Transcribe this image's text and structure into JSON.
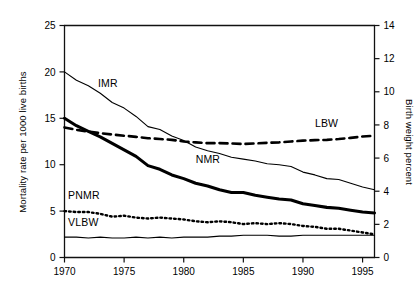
{
  "chart_data": {
    "type": "line",
    "title": "",
    "subtitle": "",
    "xlabel": "",
    "ylabel": "Mortality rate per 1000 live births",
    "y2label": "Birth weight percent",
    "xlim": [
      1970,
      1996
    ],
    "ylim": [
      0,
      25
    ],
    "y2lim": [
      0,
      14
    ],
    "grid": false,
    "legend_position": "inline-labels",
    "xticks": [
      1970,
      1975,
      1980,
      1985,
      1990,
      1995
    ],
    "xtick_labels": [
      "1970",
      "1975",
      "1980",
      "1985",
      "1990",
      "1995"
    ],
    "yticks": [
      0,
      5,
      10,
      15,
      20,
      25
    ],
    "ytick_labels": [
      "0",
      "5",
      "10",
      "15",
      "20",
      "25"
    ],
    "y2ticks": [
      0,
      2,
      4,
      6,
      8,
      10,
      12,
      14
    ],
    "y2tick_labels": [
      "0",
      "2",
      "4",
      "6",
      "8",
      "10",
      "12",
      "14"
    ],
    "x": [
      1970,
      1971,
      1972,
      1973,
      1974,
      1975,
      1976,
      1977,
      1978,
      1979,
      1980,
      1981,
      1982,
      1983,
      1984,
      1985,
      1986,
      1987,
      1988,
      1989,
      1990,
      1991,
      1992,
      1993,
      1994,
      1995,
      1996
    ],
    "series": [
      {
        "name": "IMR",
        "label": "IMR",
        "axis": "left",
        "style": "solid-thin",
        "color": "#000000",
        "values": [
          20.0,
          19.1,
          18.5,
          17.7,
          16.7,
          16.1,
          15.2,
          14.1,
          13.8,
          13.1,
          12.6,
          11.9,
          11.5,
          11.2,
          10.8,
          10.6,
          10.4,
          10.1,
          10.0,
          9.8,
          9.2,
          8.9,
          8.5,
          8.4,
          8.0,
          7.6,
          7.3
        ]
      },
      {
        "name": "NMR",
        "label": "NMR",
        "axis": "left",
        "style": "solid-bold",
        "color": "#000000",
        "values": [
          15.0,
          14.2,
          13.6,
          13.0,
          12.3,
          11.6,
          10.9,
          9.9,
          9.5,
          8.9,
          8.5,
          8.0,
          7.7,
          7.3,
          7.0,
          7.0,
          6.7,
          6.5,
          6.3,
          6.2,
          5.8,
          5.6,
          5.4,
          5.3,
          5.1,
          4.9,
          4.8
        ]
      },
      {
        "name": "PNMR",
        "label": "PNMR",
        "axis": "left",
        "style": "dotted",
        "color": "#000000",
        "values": [
          5.0,
          4.9,
          4.9,
          4.7,
          4.4,
          4.5,
          4.3,
          4.2,
          4.3,
          4.2,
          4.1,
          3.9,
          3.8,
          3.9,
          3.8,
          3.6,
          3.7,
          3.6,
          3.7,
          3.6,
          3.4,
          3.3,
          3.1,
          3.1,
          2.9,
          2.7,
          2.5
        ]
      },
      {
        "name": "VLBW",
        "label": "VLBW",
        "axis": "left",
        "style": "solid-thin",
        "color": "#000000",
        "values": [
          2.2,
          2.2,
          2.1,
          2.2,
          2.1,
          2.1,
          2.2,
          2.1,
          2.2,
          2.1,
          2.2,
          2.2,
          2.2,
          2.3,
          2.3,
          2.4,
          2.4,
          2.4,
          2.3,
          2.3,
          2.4,
          2.4,
          2.4,
          2.4,
          2.4,
          2.4,
          2.4
        ]
      },
      {
        "name": "LBW",
        "label": "LBW",
        "axis": "right",
        "style": "dashed",
        "color": "#000000",
        "values": [
          7.85,
          7.7,
          7.6,
          7.5,
          7.42,
          7.35,
          7.28,
          7.2,
          7.15,
          7.1,
          7.0,
          6.95,
          6.9,
          6.9,
          6.88,
          6.85,
          6.88,
          6.92,
          6.95,
          7.0,
          7.05,
          7.08,
          7.1,
          7.15,
          7.22,
          7.3,
          7.35
        ]
      }
    ],
    "annotations": [
      {
        "name": "imr-label",
        "text": "IMR",
        "x": 1972.8,
        "y": 18.4,
        "axis": "left"
      },
      {
        "name": "nmr-label",
        "text": "NMR",
        "x": 1981.0,
        "y": 10.2,
        "axis": "left"
      },
      {
        "name": "pnmr-label",
        "text": "PNMR",
        "x": 1970.3,
        "y": 6.3,
        "axis": "left"
      },
      {
        "name": "vlbw-label",
        "text": "VLBW",
        "x": 1970.3,
        "y": 3.4,
        "axis": "left"
      },
      {
        "name": "lbw-label",
        "text": "LBW",
        "x": 1991.0,
        "y": 7.9,
        "axis": "right"
      }
    ]
  }
}
